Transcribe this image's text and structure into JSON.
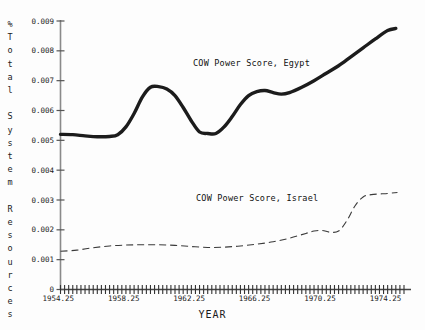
{
  "chart_data": {
    "type": "line",
    "title": "",
    "xlabel": "YEAR",
    "ylabel": "% Total System Resources",
    "xlim": [
      1954.25,
      1975.25
    ],
    "ylim": [
      0,
      0.009
    ],
    "grid": false,
    "legend_position": "inline-annotations",
    "y_ticks": [
      "0",
      "0.001",
      "0.002",
      "0.003",
      "0.004",
      "0.005",
      "0.006",
      "0.007",
      "0.008",
      "0.009"
    ],
    "y_tick_values": [
      0,
      0.001,
      0.002,
      0.003,
      0.004,
      0.005,
      0.006,
      0.007,
      0.008,
      0.009
    ],
    "x_ticks": [
      "1954.25",
      "1958.25",
      "1962.25",
      "1966.25",
      "1970.25",
      "1974.25"
    ],
    "x_tick_values": [
      1954.25,
      1958.25,
      1962.25,
      1966.25,
      1970.25,
      1974.25
    ],
    "x_minor_tick_step": 0.25,
    "series": [
      {
        "name": "COW Power Score, Egypt",
        "style": "solid",
        "color": "#1c1c1c",
        "width": 3.4,
        "x": [
          1954.25,
          1955.0,
          1955.75,
          1956.5,
          1957.25,
          1957.75,
          1958.25,
          1958.75,
          1959.25,
          1959.75,
          1960.25,
          1960.75,
          1961.25,
          1961.75,
          1962.25,
          1962.75,
          1963.25,
          1963.75,
          1964.25,
          1964.75,
          1965.25,
          1965.75,
          1966.25,
          1966.75,
          1967.25,
          1967.75,
          1968.25,
          1969.0,
          1969.75,
          1970.5,
          1971.25,
          1972.0,
          1972.75,
          1973.5,
          1974.25,
          1974.75
        ],
        "values": [
          0.0052,
          0.00519,
          0.00515,
          0.00512,
          0.00513,
          0.00519,
          0.00545,
          0.0059,
          0.00645,
          0.00678,
          0.0068,
          0.00672,
          0.0065,
          0.0061,
          0.00565,
          0.00528,
          0.00523,
          0.00523,
          0.00545,
          0.0058,
          0.0062,
          0.0065,
          0.00663,
          0.00667,
          0.0066,
          0.00655,
          0.0066,
          0.00678,
          0.007,
          0.00725,
          0.0075,
          0.0078,
          0.0081,
          0.0084,
          0.00868,
          0.00875
        ]
      },
      {
        "name": "COW Power Score, Israel",
        "style": "dashed",
        "color": "#3a3a3a",
        "width": 1.1,
        "x": [
          1954.25,
          1955.25,
          1956.25,
          1957.25,
          1958.25,
          1959.25,
          1960.25,
          1961.25,
          1962.25,
          1963.25,
          1964.25,
          1965.25,
          1966.25,
          1967.25,
          1968.25,
          1969.25,
          1969.75,
          1970.25,
          1970.75,
          1971.25,
          1971.75,
          1972.25,
          1972.75,
          1973.25,
          1974.25,
          1974.85
        ],
        "values": [
          0.00128,
          0.00132,
          0.0014,
          0.00146,
          0.00149,
          0.0015,
          0.0015,
          0.00148,
          0.00144,
          0.00141,
          0.00142,
          0.00146,
          0.00152,
          0.0016,
          0.00172,
          0.00188,
          0.00196,
          0.00198,
          0.00192,
          0.00196,
          0.0023,
          0.0028,
          0.0031,
          0.00318,
          0.00322,
          0.00325
        ]
      }
    ],
    "annotations": [
      {
        "text": "COW Power Score, Egypt",
        "x": 1963.0,
        "y": 0.0076
      },
      {
        "text": "COW Power Score, Israel",
        "x": 1963.2,
        "y": 0.00305
      }
    ]
  },
  "axis": {
    "y_label_chars": "%\nT\no\nt\na\nl\n \nS\ny\ns\nt\ne\nm\n \nR\ne\ns\no\nu\nr\nc\ne\ns",
    "x_label": "YEAR"
  },
  "colors": {
    "background": "#fdfdfd",
    "axis": "#777777",
    "text": "#1a1a1a",
    "egypt_line": "#1c1c1c",
    "israel_line": "#3a3a3a"
  }
}
